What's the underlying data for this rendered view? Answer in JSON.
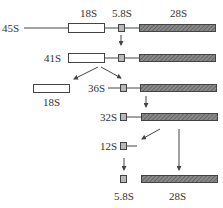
{
  "header_labels": {
    "s18": "18S",
    "s58": "5.8S",
    "s28": "28S"
  },
  "rows": {
    "r45": {
      "label": "45S"
    },
    "r41": {
      "label": "41S"
    },
    "r36": {
      "label": "36S"
    },
    "r32": {
      "label": "32S"
    },
    "r12": {
      "label": "12S"
    }
  },
  "products": {
    "p18": "18S",
    "p58": "5.8S",
    "p28": "28S"
  },
  "colors": {
    "line": "#444444",
    "white_box_fill": "#ffffff",
    "small_box_fill": "#b8b8b8",
    "hatched_fill": "#7a7a7a"
  }
}
